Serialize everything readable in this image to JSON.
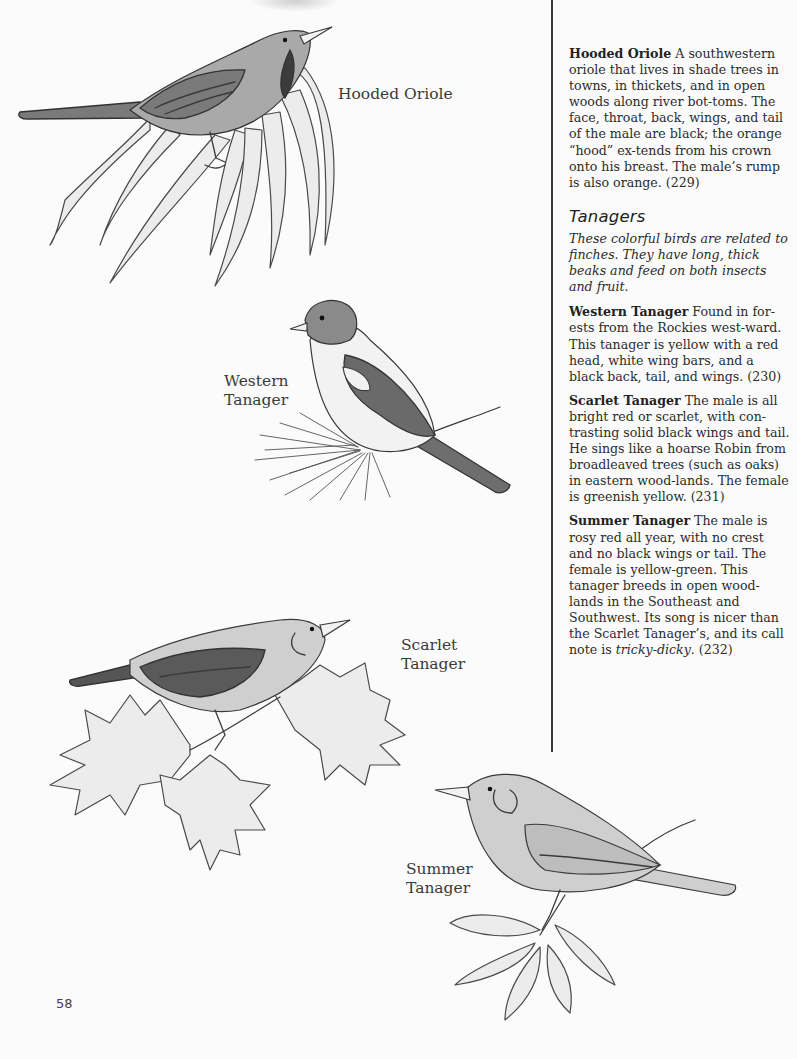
{
  "page": {
    "page_number": "58"
  },
  "illustrations": [
    {
      "id": "hooded-oriole",
      "caption_lines": [
        "Hooded Oriole"
      ]
    },
    {
      "id": "western-tanager",
      "caption_lines": [
        "Western",
        "Tanager"
      ]
    },
    {
      "id": "scarlet-tanager",
      "caption_lines": [
        "Scarlet",
        "Tanager"
      ]
    },
    {
      "id": "summer-tanager",
      "caption_lines": [
        "Summer",
        "Tanager"
      ]
    }
  ],
  "text_column": {
    "hooded_oriole": {
      "name": "Hooded Oriole",
      "body": "A southwestern oriole that lives in shade trees in towns, in thickets, and in open woods along river bot-toms. The face, throat, back, wings, and tail of the male are black; the orange “hood” ex-tends from his crown onto his breast. The male’s rump is also orange. (229)"
    },
    "section": {
      "heading": "Tanagers",
      "intro": "These colorful birds are related to finches. They have long, thick beaks and feed on both insects and fruit."
    },
    "entries": [
      {
        "name": "Western Tanager",
        "body": "Found in for-ests from the Rockies west-ward. This tanager is yellow with a red head, white wing bars, and a black back, tail, and wings. (230)"
      },
      {
        "name": "Scarlet Tanager",
        "body": "The male is all bright red or scarlet, with con-trasting solid black wings and tail. He sings like a hoarse Robin from broadleaved trees (such as oaks) in eastern wood-lands. The female is greenish yellow. (231)"
      },
      {
        "name": "Summer Tanager",
        "body_before_em": "The male is rosy red all year, with no crest and no black wings or tail. The female is yellow-green. This tanager breeds in open wood-lands in the Southeast and Southwest. Its song is nicer than the Scarlet Tanager’s, and its call note is ",
        "body_em": "tricky-dicky",
        "body_after_em": ". (232)"
      }
    ]
  }
}
